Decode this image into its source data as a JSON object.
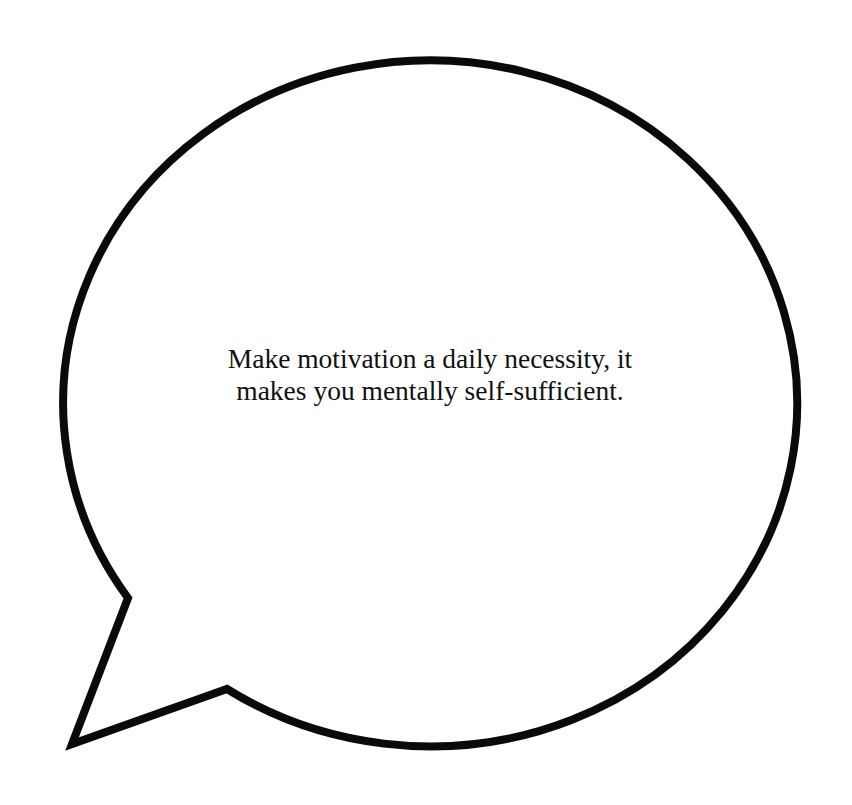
{
  "bubble": {
    "shape": "speech-bubble",
    "stroke_color": "#0a0a0a",
    "fill_color": "#ffffff",
    "tail_direction": "bottom-left"
  },
  "quote": {
    "lines": [
      "Make motivation a daily necessity, it",
      "makes you mentally self-sufficient."
    ],
    "full_text": "Make motivation a daily necessity, it makes you mentally self-sufficient."
  },
  "background_color": "#ffffff"
}
